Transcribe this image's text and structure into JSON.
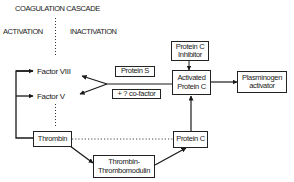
{
  "title": "COAGULATION CASCADE",
  "columns": {
    "left": "ACTIVATION",
    "right": "INACTIVATION"
  },
  "nodes": {
    "factor_viii": "Factor VIII",
    "factor_v": "Factor V",
    "thrombin": "Thrombin",
    "thrombin_thrombomodulin": {
      "line1": "Thrombin-",
      "line2": "Thrombomodulin"
    },
    "protein_c": "Protein C",
    "activated_protein_c": {
      "line1": "Activated",
      "line2": "Protein C"
    },
    "protein_c_inhibitor": {
      "line1": "Protein C",
      "line2": "Inhibitor"
    },
    "plasminogen_activator": {
      "line1": "Plasminogen",
      "line2": "activator"
    },
    "protein_s": "Protein S",
    "cofactor": "+ ? co-factor"
  },
  "edges": [
    {
      "from": "thrombin",
      "to": "factor_viii",
      "style": "solid",
      "label": "activation bracket"
    },
    {
      "from": "thrombin",
      "to": "factor_v",
      "style": "solid",
      "label": "activation bracket"
    },
    {
      "from": "thrombin",
      "to": "protein_c",
      "style": "dotted"
    },
    {
      "from": "thrombin",
      "to": "thrombin_thrombomodulin",
      "style": "solid"
    },
    {
      "from": "thrombin_thrombomodulin",
      "to": "protein_c",
      "style": "solid"
    },
    {
      "from": "protein_c",
      "to": "activated_protein_c",
      "style": "arrow"
    },
    {
      "from": "protein_c_inhibitor",
      "to": "activated_protein_c",
      "style": "arrow"
    },
    {
      "from": "activated_protein_c",
      "to": "plasminogen_activator",
      "style": "arrow"
    },
    {
      "from": "activated_protein_c",
      "to": "factor_viii",
      "style": "arrow"
    },
    {
      "from": "activated_protein_c",
      "to": "factor_v",
      "style": "arrow"
    }
  ],
  "colors": {
    "ink": "#1a1a1a",
    "background": "#ffffff"
  }
}
